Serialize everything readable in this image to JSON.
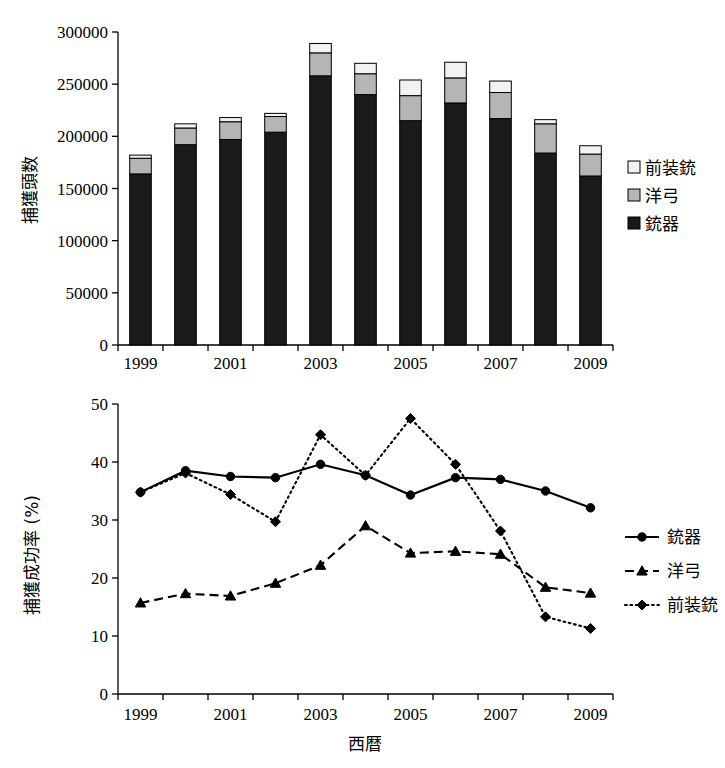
{
  "figure": {
    "background": "#ffffff",
    "ink": "#000000"
  },
  "bar_chart": {
    "y_axis_title": "捕獲頭数",
    "y_ticks": [
      "0",
      "50000",
      "100000",
      "150000",
      "200000",
      "250000",
      "300000"
    ],
    "x_ticks": [
      "1999",
      "",
      "2001",
      "",
      "2003",
      "",
      "2005",
      "",
      "2007",
      "",
      "2009"
    ],
    "legend": [
      {
        "label": "前装銃",
        "swatch": "#f2f2f2",
        "name": "muzzleloader"
      },
      {
        "label": "洋弓",
        "swatch": "#b5b5b5",
        "name": "archery"
      },
      {
        "label": "銃器",
        "swatch": "#1a1a1a",
        "name": "firearm"
      }
    ]
  },
  "line_chart": {
    "y_axis_title": "捕獲成功率 (%)",
    "x_axis_title": "西暦",
    "y_ticks": [
      "0",
      "10",
      "20",
      "30",
      "40",
      "50"
    ],
    "x_ticks": [
      "1999",
      "",
      "2001",
      "",
      "2003",
      "",
      "2005",
      "",
      "2007",
      "",
      "2009"
    ],
    "legend": [
      {
        "label": "銃器",
        "style": "solid",
        "marker": "circle"
      },
      {
        "label": "洋弓",
        "style": "dashed",
        "marker": "triangle"
      },
      {
        "label": "前装銃",
        "style": "dotted",
        "marker": "diamond"
      }
    ]
  },
  "chart_data": [
    {
      "type": "bar",
      "subtype": "stacked-vertical",
      "title": "",
      "xlabel": "",
      "ylabel": "捕獲頭数",
      "categories": [
        1999,
        2000,
        2001,
        2002,
        2003,
        2004,
        2005,
        2006,
        2007,
        2008,
        2009
      ],
      "ylim": [
        0,
        300000
      ],
      "ytick_step": 50000,
      "grid": false,
      "legend_position": "right",
      "series": [
        {
          "name": "銃器",
          "color": "#1a1a1a",
          "values": [
            164000,
            192000,
            197000,
            204000,
            258000,
            240000,
            215000,
            232000,
            217000,
            184000,
            162000
          ]
        },
        {
          "name": "洋弓",
          "color": "#b5b5b5",
          "values": [
            15000,
            16000,
            17000,
            15000,
            22000,
            20000,
            24000,
            24000,
            25000,
            28000,
            21000
          ]
        },
        {
          "name": "前装銃",
          "color": "#f2f2f2",
          "values": [
            3000,
            4000,
            4000,
            3000,
            9000,
            10000,
            15000,
            15000,
            11000,
            4000,
            8000
          ]
        }
      ],
      "totals": [
        182000,
        212000,
        218000,
        222000,
        289000,
        270000,
        254000,
        271000,
        253000,
        216000,
        191000
      ]
    },
    {
      "type": "line",
      "title": "",
      "xlabel": "西暦",
      "ylabel": "捕獲成功率 (%)",
      "x": [
        1999,
        2000,
        2001,
        2002,
        2003,
        2004,
        2005,
        2006,
        2007,
        2008,
        2009
      ],
      "ylim": [
        0,
        50
      ],
      "ytick_step": 10,
      "grid": false,
      "legend_position": "right",
      "series": [
        {
          "name": "銃器",
          "style": "solid",
          "marker": "circle",
          "values": [
            34.8,
            38.5,
            37.5,
            37.3,
            39.6,
            37.7,
            34.3,
            37.3,
            37.0,
            35.0,
            32.1
          ]
        },
        {
          "name": "洋弓",
          "style": "dashed",
          "marker": "triangle",
          "values": [
            15.7,
            17.3,
            16.9,
            19.1,
            22.2,
            29.0,
            24.3,
            24.6,
            24.1,
            18.4,
            17.4
          ]
        },
        {
          "name": "前装銃",
          "style": "dotted",
          "marker": "diamond",
          "values": [
            34.8,
            38.1,
            34.4,
            29.7,
            44.7,
            37.7,
            47.5,
            39.6,
            28.1,
            13.3,
            11.3
          ]
        }
      ]
    }
  ]
}
